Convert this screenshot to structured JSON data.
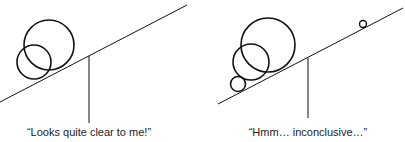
{
  "panels": [
    {
      "id": "left",
      "caption": "“Looks quite clear to me!”",
      "circles": [
        {
          "cx": 49,
          "cy": 45,
          "r": 25
        },
        {
          "cx": 34,
          "cy": 62,
          "r": 17
        }
      ]
    },
    {
      "id": "right",
      "caption": "“Hmm… inconclusive…”",
      "circles": [
        {
          "cx": 268,
          "cy": 45,
          "r": 27
        },
        {
          "cx": 251,
          "cy": 62,
          "r": 18
        },
        {
          "cx": 238,
          "cy": 84,
          "r": 7.5
        },
        {
          "cx": 363,
          "cy": 24,
          "r": 3.5
        }
      ]
    }
  ],
  "colors": {
    "stroke": "#111111",
    "text": "#222222"
  }
}
